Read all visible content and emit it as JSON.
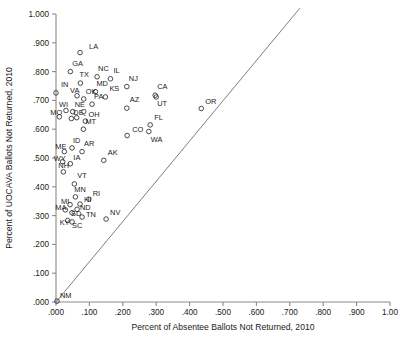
{
  "chart_data": {
    "type": "scatter",
    "title": "",
    "xlabel": "Percent of Absentee Ballots Not Returned, 2010",
    "ylabel": "Percent of UOCAVA Ballots Not Returned, 2010",
    "xlim": [
      0,
      1.0
    ],
    "ylim": [
      0,
      1.0
    ],
    "grid": false,
    "legend": false,
    "xticks": [
      0,
      0.1,
      0.2,
      0.3,
      0.4,
      0.5,
      0.6,
      0.7,
      0.8,
      0.9,
      1.0
    ],
    "xtick_labels": [
      ".000",
      ".100",
      ".200",
      ".300",
      ".400",
      ".500",
      ".600",
      ".700",
      ".800",
      ".900",
      "1.00"
    ],
    "yticks": [
      0,
      0.1,
      0.2,
      0.3,
      0.4,
      0.5,
      0.6,
      0.7,
      0.8,
      0.9,
      1.0
    ],
    "ytick_labels": [
      ".000",
      ".100",
      ".200",
      ".300",
      ".400",
      ".500",
      ".600",
      ".700",
      ".800",
      ".900",
      "1.000"
    ],
    "annotations": [
      {
        "name": "reference-line",
        "type": "line",
        "x0": 0.0,
        "y0": 0.0,
        "x1": 0.73,
        "y1": 1.02,
        "note": "diagonal reference line"
      }
    ],
    "points": [
      {
        "label": "LA",
        "x": 0.072,
        "y": 0.866,
        "lx": 9,
        "ly": -4
      },
      {
        "label": "GA",
        "x": 0.043,
        "y": 0.8,
        "lx": 2,
        "ly": -6
      },
      {
        "label": "NC",
        "x": 0.123,
        "y": 0.782,
        "lx": 1,
        "ly": -6
      },
      {
        "label": "IL",
        "x": 0.163,
        "y": 0.775,
        "lx": 3,
        "ly": -6
      },
      {
        "label": "TX",
        "x": 0.073,
        "y": 0.76,
        "lx": -1,
        "ly": -6
      },
      {
        "label": "NJ",
        "x": 0.212,
        "y": 0.748,
        "lx": 2,
        "ly": -6
      },
      {
        "label": "IN",
        "x": 0.0,
        "y": 0.726,
        "lx": 5,
        "ly": -6
      },
      {
        "label": "MD",
        "x": 0.118,
        "y": 0.73,
        "lx": 1,
        "ly": -6
      },
      {
        "label": "KS",
        "x": 0.148,
        "y": 0.712,
        "lx": 4,
        "ly": -6
      },
      {
        "label": "CA",
        "x": 0.297,
        "y": 0.718,
        "lx": 2,
        "ly": -6
      },
      {
        "label": "UT",
        "x": 0.3,
        "y": 0.712,
        "lx": 1,
        "ly": 9
      },
      {
        "label": "VA",
        "x": 0.063,
        "y": 0.716,
        "lx": -7,
        "ly": -3
      },
      {
        "label": "OK",
        "x": 0.083,
        "y": 0.705,
        "lx": 2,
        "ly": -5
      },
      {
        "label": "AZ",
        "x": 0.212,
        "y": 0.673,
        "lx": 3,
        "ly": -6
      },
      {
        "label": "PA",
        "x": 0.108,
        "y": 0.687,
        "lx": 2,
        "ly": -5
      },
      {
        "label": "OR",
        "x": 0.435,
        "y": 0.672,
        "lx": 4,
        "ly": -4
      },
      {
        "label": "WI",
        "x": 0.03,
        "y": 0.665,
        "lx": -7,
        "ly": -3
      },
      {
        "label": "NE",
        "x": 0.05,
        "y": 0.661,
        "lx": 2,
        "ly": -5
      },
      {
        "label": "MO",
        "x": 0.01,
        "y": 0.643,
        "lx": -9,
        "ly": -2
      },
      {
        "label": "DE",
        "x": 0.046,
        "y": 0.637,
        "lx": 2,
        "ly": -4
      },
      {
        "label": "IA2",
        "x": 0.062,
        "y": 0.64,
        "lx": 4,
        "ly": -4,
        "text": "Q"
      },
      {
        "label": "OH",
        "x": 0.088,
        "y": 0.628,
        "lx": 3,
        "ly": -4
      },
      {
        "label": "CO",
        "x": 0.213,
        "y": 0.578,
        "lx": 5,
        "ly": -4
      },
      {
        "label": "FL",
        "x": 0.282,
        "y": 0.615,
        "lx": 4,
        "ly": -5
      },
      {
        "label": "WA",
        "x": 0.278,
        "y": 0.592,
        "lx": 2,
        "ly": 10
      },
      {
        "label": "MT",
        "x": 0.082,
        "y": 0.6,
        "lx": 2,
        "ly": -5
      },
      {
        "label": "ID",
        "x": 0.048,
        "y": 0.535,
        "lx": 1,
        "ly": -5
      },
      {
        "label": "ME",
        "x": 0.025,
        "y": 0.522,
        "lx": -9,
        "ly": -3
      },
      {
        "label": "AR",
        "x": 0.078,
        "y": 0.522,
        "lx": 2,
        "ly": -6
      },
      {
        "label": "WY",
        "x": 0.02,
        "y": 0.487,
        "lx": -9,
        "ly": -1
      },
      {
        "label": "IA",
        "x": 0.043,
        "y": 0.48,
        "lx": 3,
        "ly": -4
      },
      {
        "label": "AK",
        "x": 0.143,
        "y": 0.492,
        "lx": 4,
        "ly": -5
      },
      {
        "label": "NH",
        "x": 0.022,
        "y": 0.452,
        "lx": -5,
        "ly": -4
      },
      {
        "label": "VT",
        "x": 0.055,
        "y": 0.41,
        "lx": 3,
        "ly": -6
      },
      {
        "label": "MN",
        "x": 0.058,
        "y": 0.365,
        "lx": -1,
        "ly": -5
      },
      {
        "label": "RI",
        "x": 0.098,
        "y": 0.357,
        "lx": 4,
        "ly": -3
      },
      {
        "label": "MI",
        "x": 0.042,
        "y": 0.338,
        "lx": -9,
        "ly": -1
      },
      {
        "label": "HI",
        "x": 0.072,
        "y": 0.34,
        "lx": 4,
        "ly": -2
      },
      {
        "label": "MA",
        "x": 0.028,
        "y": 0.32,
        "lx": -10,
        "ly": 0
      },
      {
        "label": "ND",
        "x": 0.063,
        "y": 0.322,
        "lx": 3,
        "ly": 1
      },
      {
        "label": "SD",
        "x": 0.048,
        "y": 0.31,
        "lx": -1,
        "ly": 3
      },
      {
        "label": "NV",
        "x": 0.15,
        "y": 0.288,
        "lx": 4,
        "ly": -4
      },
      {
        "label": "TN",
        "x": 0.078,
        "y": 0.295,
        "lx": 4,
        "ly": 0
      },
      {
        "label": "KY",
        "x": 0.035,
        "y": 0.283,
        "lx": -8,
        "ly": 5
      },
      {
        "label": "SC",
        "x": 0.048,
        "y": 0.278,
        "lx": 0,
        "ly": 6
      },
      {
        "label": "NM",
        "x": 0.003,
        "y": 0.003,
        "lx": 3,
        "ly": -3
      }
    ]
  },
  "figure": {
    "tick_len": 4
  }
}
